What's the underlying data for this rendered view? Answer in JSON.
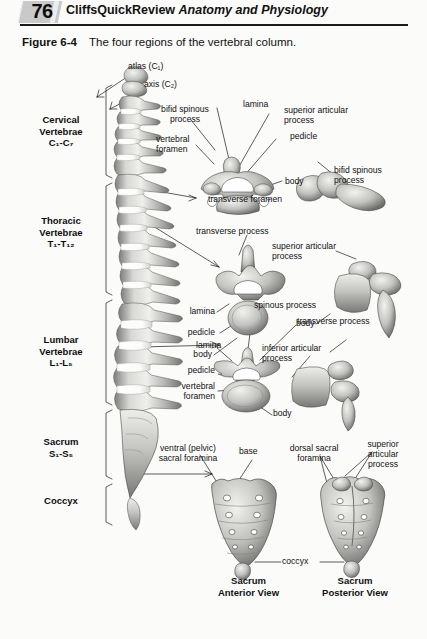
{
  "header": {
    "folio": "76",
    "series_title": "CliffsQuickReview",
    "book_title": "Anatomy and Physiology"
  },
  "figure": {
    "label": "Figure 6-4",
    "caption": "The four regions of the vertebral column."
  },
  "regions": [
    {
      "name": "cervical",
      "line1": "Cervical",
      "line2": "Vertebrae",
      "line3": "C₁-C₇"
    },
    {
      "name": "thoracic",
      "line1": "Thoracic",
      "line2": "Vertebrae",
      "line3": "T₁-T₁₂"
    },
    {
      "name": "lumbar",
      "line1": "Lumbar",
      "line2": "Vertebrae",
      "line3": "L₁-L₅"
    },
    {
      "name": "sacrum",
      "line1": "Sacrum",
      "line2": "S₁-S₅",
      "line3": ""
    },
    {
      "name": "coccyx",
      "line1": "Coccyx",
      "line2": "",
      "line3": ""
    }
  ],
  "callouts": {
    "atlas": "atlas (C₁)",
    "axis": "axis (C₂)",
    "cervical_bifid_spinous": "bifid spinous\nprocess",
    "cervical_vertebral_foramen": "vertebral\nforamen",
    "cervical_lamina": "lamina",
    "cervical_superior_articular": "superior articular\nprocess",
    "cervical_pedicle": "pedicle",
    "cervical_body": "body",
    "cervical_transverse_foramen": "transverse foramen",
    "cervical_lateral_bifid_spinous": "bifid spinous\nprocess",
    "thoracic_transverse_process": "transverse process",
    "thoracic_lamina": "lamina",
    "thoracic_pedicle": "pedicle",
    "thoracic_body": "body",
    "thoracic_superior_articular": "superior articular\nprocess",
    "thoracic_lateral_body": "body",
    "thoracic_inferior_articular": "inferior articular\nprocess",
    "lumbar_lamina": "lamina",
    "lumbar_spinous_process": "spinous process",
    "lumbar_transverse_process": "transverse process",
    "lumbar_pedicle": "pedicle",
    "lumbar_vertebral_foramen": "vertebral\nforamen",
    "lumbar_body": "body",
    "sacrum_ventral_foramina": "ventral (pelvic)\nsacral foramina",
    "sacrum_base": "base",
    "sacrum_dorsal_foramina": "dorsal sacral\nforamina",
    "sacrum_superior_articular": "superior\narticular\nprocess",
    "coccyx_label": "coccyx"
  },
  "view_labels": {
    "anterior": "Sacrum\nAnterior View",
    "posterior": "Sacrum\nPosterior View"
  },
  "colors": {
    "ink": "#111111",
    "rule": "#1a1a1a",
    "folio_block": "#c9c9c9",
    "bone_light": "#e8e8e6",
    "bone_mid": "#b4b4b2",
    "bone_dark": "#6f6f6e",
    "page": "#fbfbfa"
  }
}
